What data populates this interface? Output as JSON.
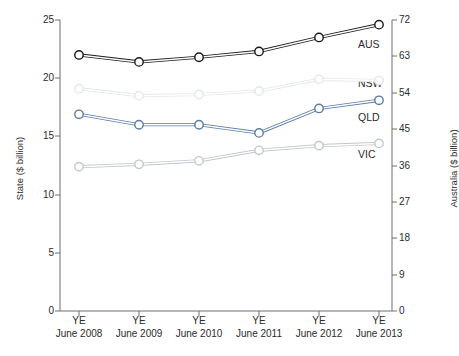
{
  "chart_data": {
    "type": "line",
    "title": "",
    "subtitle": "",
    "xlabel": "",
    "ylabel": "State ($ billion)",
    "y2label": "Australia ($ billion)",
    "categories": [
      "YE\nJune 2008",
      "YE\nJune 2009",
      "YE\nJune 2010",
      "YE\nJune 2011",
      "YE\nJune 2012",
      "YE\nJune 2013"
    ],
    "x_tick_lines": [
      {
        "line1": "YE",
        "line2": "June 2008"
      },
      {
        "line1": "YE",
        "line2": "June 2009"
      },
      {
        "line1": "YE",
        "line2": "June 2010"
      },
      {
        "line1": "YE",
        "line2": "June 2011"
      },
      {
        "line1": "YE",
        "line2": "June 2012"
      },
      {
        "line1": "YE",
        "line2": "June 2013"
      }
    ],
    "ylim": [
      0,
      25
    ],
    "yticks": [
      0,
      5,
      10,
      15,
      20,
      25
    ],
    "y2lim": [
      0,
      72
    ],
    "y2ticks": [
      0,
      9,
      18,
      27,
      36,
      45,
      54,
      63,
      72
    ],
    "grid": false,
    "legend_position": "right-inline-labels",
    "series": [
      {
        "name": "AUS",
        "axis": "right",
        "color": "#1a1a1a",
        "marker": "open-circle",
        "values_right_axis": [
          63.4,
          61.6,
          62.8,
          64.2,
          67.7,
          70.8
        ],
        "values_plot_scale": [
          22.0,
          21.4,
          21.8,
          22.3,
          23.5,
          24.6
        ]
      },
      {
        "name": "NSW",
        "axis": "left",
        "color": "#e4e7ec",
        "marker": "open-circle",
        "values": [
          19.1,
          18.5,
          18.6,
          18.9,
          19.9,
          19.8
        ]
      },
      {
        "name": "QLD",
        "axis": "left",
        "color": "#5b7ba8",
        "marker": "open-circle",
        "values": [
          16.9,
          16.0,
          16.0,
          15.3,
          17.4,
          18.1
        ]
      },
      {
        "name": "VIC",
        "axis": "left",
        "color": "#c3c7cc",
        "marker": "open-circle",
        "values": [
          12.4,
          12.6,
          12.9,
          13.8,
          14.2,
          14.4
        ]
      }
    ],
    "series_labels": [
      {
        "text": "AUS",
        "x": 358,
        "y": 44
      },
      {
        "text": "NSW",
        "x": 358,
        "y": 83
      },
      {
        "text": "QLD",
        "x": 358,
        "y": 117
      },
      {
        "text": "VIC",
        "x": 358,
        "y": 154
      }
    ]
  },
  "colors": {
    "aus": "#1a1a1a",
    "nsw": "#e4e7ec",
    "qld": "#5b7ba8",
    "vic": "#c3c7cc",
    "axis": "#6f6f6f",
    "text": "#2b2b2b",
    "background": "#ffffff"
  }
}
